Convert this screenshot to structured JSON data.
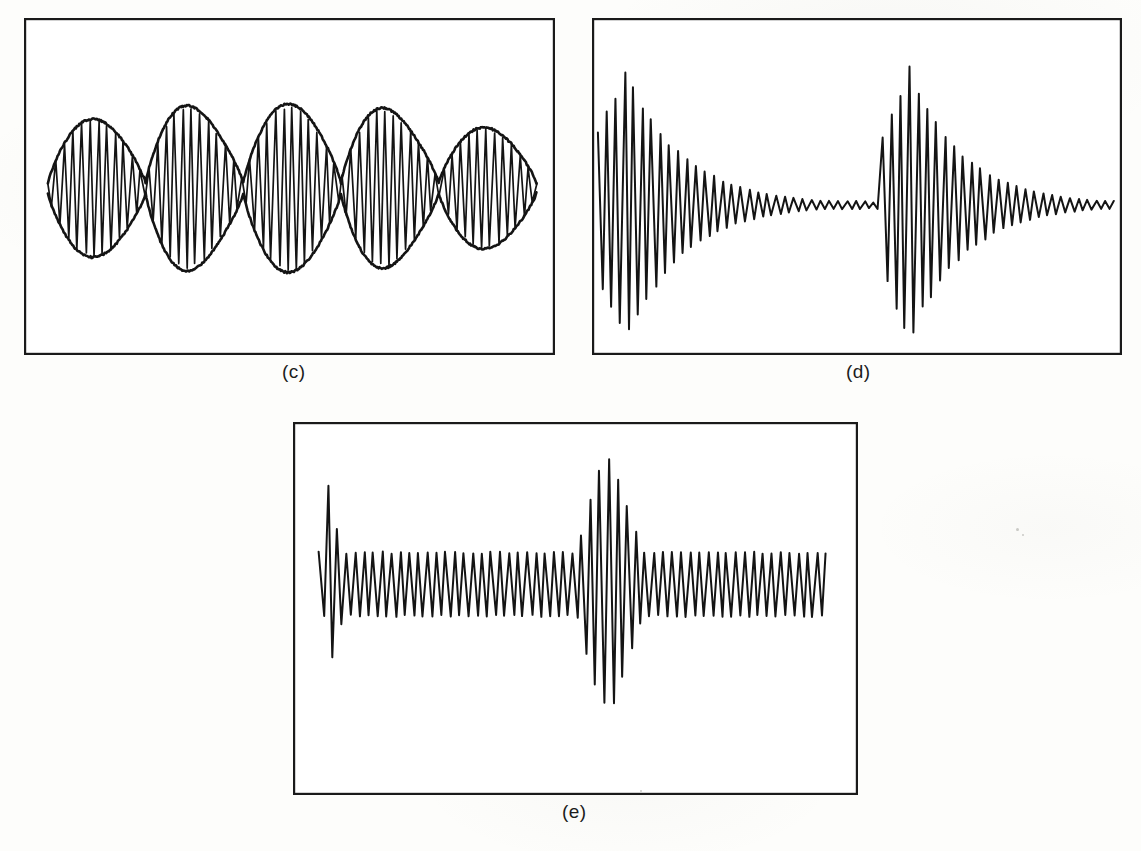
{
  "figure": {
    "background_color": "#fdfdfb",
    "ink_color": "#141414",
    "frame_color": "#1a1a1a",
    "width": 1141,
    "height": 851,
    "style": "hand-drawn scanned oscilloscope waveform figure"
  },
  "panels": [
    {
      "id": "c",
      "caption": "(c)",
      "name": "beat-amplitude-modulated-waveform",
      "description": "Carrier oscillation filling a hand-drawn beat envelope with five lobes and four nodes",
      "frame": {
        "x": 24,
        "y": 18,
        "width": 531,
        "height": 337
      },
      "caption_position": {
        "x": 282,
        "y": 361
      }
    },
    {
      "id": "d",
      "caption": "(d)",
      "name": "two-decaying-transient-bursts",
      "description": "Two exponentially decaying oscillation bursts separated by a near-silent flat region",
      "frame": {
        "x": 592,
        "y": 18,
        "width": 530,
        "height": 337
      },
      "caption_position": {
        "x": 846,
        "y": 361
      }
    },
    {
      "id": "e",
      "caption": "(e)",
      "name": "steady-oscillation-with-transients",
      "description": "Steady periodic oscillation with an initial decaying transient and a large central swelling transient",
      "frame": {
        "x": 293,
        "y": 422,
        "width": 565,
        "height": 373
      },
      "caption_position": {
        "x": 562,
        "y": 801
      }
    }
  ],
  "chart_data": [
    {
      "type": "line",
      "panel": "c",
      "title": "(c)",
      "signal": "amplitude-modulated beat waveform",
      "xlabel": "time",
      "ylabel": "amplitude",
      "grid": false,
      "legend": false,
      "axes_visible": false,
      "baseline_y": 0,
      "carrier_cycles": 58,
      "envelope_lobes": 5,
      "envelope_nodes": 4,
      "envelope_drawn": true,
      "envelope_peak_amplitudes": [
        0.82,
        0.98,
        1.0,
        0.95,
        0.72
      ],
      "envelope_node_amplitude": 0.06,
      "starts_at_node": true,
      "ends_mid_lobe": true,
      "x_start_frac": 0.045,
      "x_end_frac": 0.965,
      "ylim": [
        -1.15,
        1.15
      ]
    },
    {
      "type": "line",
      "panel": "d",
      "title": "(d)",
      "signal": "two decaying transient bursts",
      "xlabel": "time",
      "ylabel": "amplitude",
      "grid": false,
      "legend": false,
      "axes_visible": false,
      "baseline_y": 0,
      "bursts": [
        {
          "name": "first-burst",
          "onset_frac": 0.0,
          "attack_cycles": 3,
          "peak_amplitude": 1.0,
          "decay_constant": 0.11,
          "cycles": 30
        },
        {
          "name": "second-burst",
          "onset_frac": 0.545,
          "attack_cycles": 4,
          "peak_amplitude": 1.02,
          "decay_constant": 0.105,
          "cycles": 28
        }
      ],
      "quiet_region": {
        "start_frac": 0.4,
        "end_frac": 0.545,
        "residual_amplitude": 0.03
      },
      "cycle_count_total": 58,
      "ylim": [
        -1.15,
        1.15
      ]
    },
    {
      "type": "line",
      "panel": "e",
      "title": "(e)",
      "signal": "steady oscillation with initial and central transients",
      "xlabel": "time",
      "ylabel": "amplitude",
      "grid": false,
      "legend": false,
      "axes_visible": false,
      "baseline_y": 0,
      "steady_amplitude": 0.27,
      "transients": [
        {
          "name": "initial-transient",
          "center_frac": 0.015,
          "peak_amplitude": 0.93,
          "shape": "decaying",
          "decay_cycles": 4
        },
        {
          "name": "central-transient",
          "center_frac": 0.565,
          "peak_amplitude": 1.05,
          "shape": "swell-and-decay",
          "rise_cycles": 4,
          "decay_cycles": 5
        }
      ],
      "cycle_count_total": 56,
      "ylim": [
        -1.2,
        1.2
      ]
    }
  ]
}
